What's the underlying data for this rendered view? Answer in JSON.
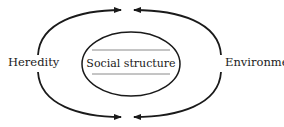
{
  "diagram": {
    "left_label": "Heredity",
    "center_label": "Social structure",
    "right_label": "Environment",
    "stroke_color": "#1a1a1a",
    "rule_color": "#8a8a8a",
    "arrows": [
      {
        "from": "Heredity",
        "to": "top-center",
        "direction": "right"
      },
      {
        "from": "Environment",
        "to": "top-center",
        "direction": "left"
      },
      {
        "from": "Heredity",
        "to": "bottom-center",
        "direction": "right"
      },
      {
        "from": "Environment",
        "to": "bottom-center",
        "direction": "left"
      }
    ]
  }
}
